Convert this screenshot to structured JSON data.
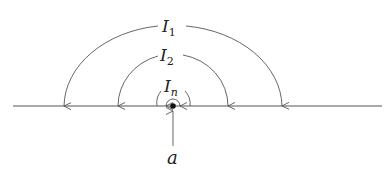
{
  "diagram": {
    "labels": {
      "arc_outer": {
        "main": "I",
        "sub": "1"
      },
      "arc_middle": {
        "main": "I",
        "sub": "2"
      },
      "arc_inner": {
        "main": "I",
        "sub": "n"
      },
      "point": "a"
    },
    "colors": {
      "stroke": "#555555",
      "dot": "#111111"
    }
  }
}
